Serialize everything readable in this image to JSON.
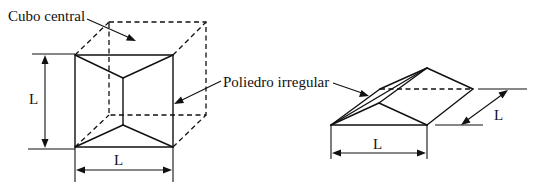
{
  "figure": {
    "labels": {
      "central_cube": "Cubo central",
      "irregular_polyhedron": "Poliedro irregular",
      "dim_left_vertical": "L",
      "dim_left_horizontal": "L",
      "dim_right_horizontal": "L",
      "dim_right_diagonal": "L"
    },
    "colors": {
      "stroke": "#111111",
      "background": "#ffffff"
    },
    "left_view": {
      "description": "Front view of cube decomposed into central cube and pyramidal irregular polyhedra",
      "front_square": {
        "x1": 75,
        "y1": 55,
        "x2": 173,
        "y2": 147
      },
      "back_square_dashed": {
        "x1": 109,
        "y1": 22,
        "x2": 206,
        "y2": 115
      },
      "inner_top_vertex": [
        123,
        78
      ],
      "inner_bottom_vertex": [
        123,
        125
      ]
    },
    "right_view": {
      "description": "Isometric view of irregular polyhedron",
      "vertices": {
        "bottom_left": [
          331,
          125
        ],
        "bottom_right": [
          427,
          125
        ],
        "apex": [
          427,
          68
        ],
        "right": [
          473,
          89
        ],
        "back_left": [
          380,
          89
        ],
        "front_peak": [
          379,
          103
        ]
      }
    }
  }
}
